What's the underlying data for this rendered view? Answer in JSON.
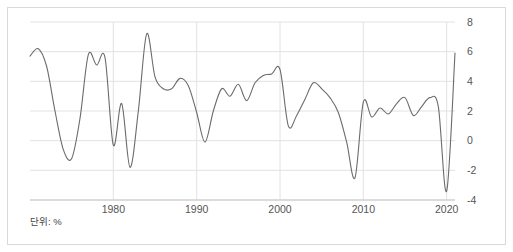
{
  "figure": {
    "unit_label": "단위: %",
    "line_color": "#6b6b6b",
    "grid_color": "#e2e2e6",
    "axis_color": "#cfcfcf",
    "frame_color": "#d9d9d9",
    "tick_label_color": "#555555",
    "background": "#ffffff"
  },
  "chart_data": {
    "type": "line",
    "title": "",
    "subtitle": "",
    "xlabel": "",
    "ylabel": "",
    "unit": "%",
    "grid": true,
    "legend": "none",
    "xlim": [
      1970,
      2021
    ],
    "ylim": [
      -4,
      8
    ],
    "yticks": [
      8,
      6,
      4,
      2,
      0,
      -2,
      -4
    ],
    "ytick_labels": [
      "8",
      "6",
      "4",
      "2",
      "0",
      "-2",
      "-4"
    ],
    "yaxis_position": "right",
    "xticks": [
      1980,
      1990,
      2000,
      2010,
      2020
    ],
    "xtick_labels": [
      "1980",
      "1990",
      "2000",
      "2010",
      "2020"
    ],
    "series": [
      {
        "name": "growth-rate",
        "x": [
          1970,
          1971,
          1972,
          1973,
          1974,
          1975,
          1976,
          1977,
          1978,
          1979,
          1980,
          1981,
          1982,
          1983,
          1984,
          1985,
          1986,
          1987,
          1988,
          1989,
          1990,
          1991,
          1992,
          1993,
          1994,
          1995,
          1996,
          1997,
          1998,
          1999,
          2000,
          2001,
          2002,
          2003,
          2004,
          2005,
          2006,
          2007,
          2008,
          2009,
          2010,
          2011,
          2012,
          2013,
          2014,
          2015,
          2016,
          2017,
          2018,
          2019,
          2020,
          2021
        ],
        "values": [
          5.7,
          6.2,
          5.0,
          2.0,
          -0.6,
          -1.2,
          1.5,
          5.8,
          5.1,
          5.6,
          -0.3,
          2.5,
          -1.8,
          2.0,
          7.2,
          4.3,
          3.5,
          3.5,
          4.2,
          3.7,
          1.9,
          -0.1,
          2.0,
          3.5,
          3.0,
          3.8,
          2.7,
          3.9,
          4.4,
          4.5,
          4.8,
          1.0,
          1.7,
          2.8,
          3.9,
          3.5,
          2.9,
          1.9,
          -0.1,
          -2.5,
          2.6,
          1.6,
          2.2,
          1.8,
          2.5,
          2.9,
          1.7,
          2.3,
          2.9,
          2.3,
          -3.4,
          5.9
        ]
      }
    ]
  }
}
